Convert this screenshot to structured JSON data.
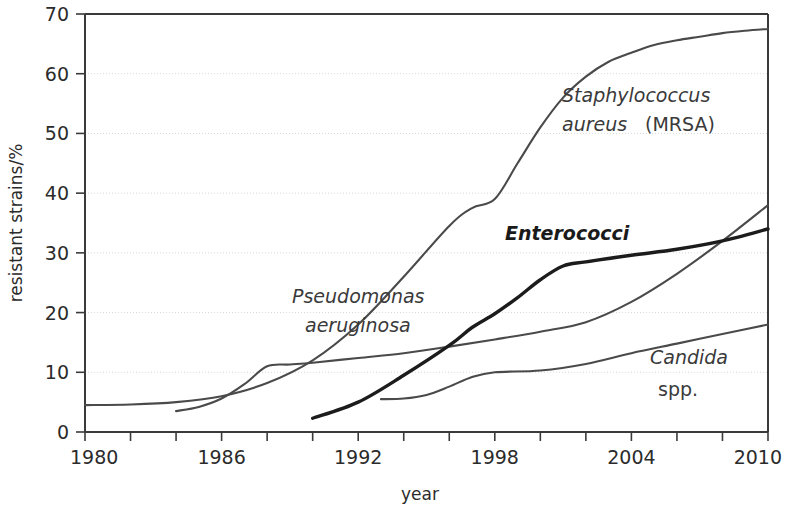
{
  "chart_data": {
    "type": "line",
    "title": "",
    "xlabel": "year",
    "ylabel": "resistant strains/%",
    "xlim": [
      1980,
      2010
    ],
    "ylim": [
      0,
      70
    ],
    "grid": true,
    "legend_position": "inline-annotations",
    "x_ticks_major": [
      1980,
      1986,
      1992,
      1998,
      2004,
      2010
    ],
    "x_ticks_minor": [
      1982,
      1984,
      1988,
      1990,
      1994,
      1996,
      2000,
      2002,
      2006,
      2008
    ],
    "y_ticks": [
      0,
      10,
      20,
      30,
      40,
      50,
      60,
      70
    ],
    "series": [
      {
        "name": "Staphylococcus aureus (MRSA)",
        "label_italic": "Staphylococcus",
        "label_italic_2": "aureus",
        "label_roman": "(MRSA)",
        "style": "thin",
        "x": [
          1980,
          1982,
          1984,
          1986,
          1988,
          1990,
          1992,
          1994,
          1996,
          1997,
          1998,
          1999,
          2000,
          2001,
          2002,
          2003,
          2004,
          2005,
          2006,
          2007,
          2008,
          2009,
          2010
        ],
        "values": [
          4.5,
          4.6,
          5.0,
          6.0,
          8.2,
          12.0,
          18.0,
          26.0,
          34.5,
          37.5,
          39.0,
          45.0,
          51.0,
          56.0,
          59.5,
          62.0,
          63.5,
          64.8,
          65.6,
          66.2,
          66.8,
          67.2,
          67.5
        ]
      },
      {
        "name": "Pseudomonas aeruginosa",
        "label_italic": "Pseudomonas",
        "label_italic_2": "aeruginosa",
        "style": "thin",
        "x": [
          1984,
          1985,
          1986,
          1987,
          1988,
          1989,
          1990,
          1992,
          1994,
          1996,
          1998,
          2000,
          2002,
          2004,
          2006,
          2008,
          2010
        ],
        "values": [
          3.5,
          4.2,
          5.6,
          8.0,
          11.0,
          11.3,
          11.6,
          12.4,
          13.2,
          14.3,
          15.5,
          16.8,
          18.4,
          21.8,
          26.5,
          32.0,
          38.0
        ]
      },
      {
        "name": "Enterococci",
        "label_bold_italic": "Enterococci",
        "style": "bold",
        "x": [
          1990,
          1992,
          1994,
          1996,
          1997,
          1998,
          1999,
          2000,
          2001,
          2002,
          2004,
          2006,
          2008,
          2010
        ],
        "values": [
          2.3,
          5.0,
          9.5,
          14.5,
          17.5,
          19.8,
          22.5,
          25.5,
          27.8,
          28.5,
          29.6,
          30.6,
          32.0,
          34.0
        ]
      },
      {
        "name": "Candida spp.",
        "label_italic": "Candida",
        "label_roman": "spp.",
        "style": "thin",
        "x": [
          1993,
          1994,
          1995,
          1996,
          1997,
          1998,
          2000,
          2002,
          2004,
          2006,
          2008,
          2010
        ],
        "values": [
          5.5,
          5.6,
          6.2,
          7.6,
          9.2,
          10.0,
          10.3,
          11.4,
          13.2,
          14.8,
          16.4,
          18.0
        ]
      }
    ],
    "annotations": [
      {
        "text": "Staphylococcus aureus (MRSA)",
        "x": 1998.5,
        "y": 56
      },
      {
        "text": "Pseudomonas aeruginosa",
        "x": 1988.5,
        "y": 24
      },
      {
        "text": "Enterococci",
        "x": 1995.5,
        "y": 33
      },
      {
        "text": "Candida spp.",
        "x": 2004.5,
        "y": 10
      }
    ]
  },
  "axes": {
    "y_title": "resistant strains/%",
    "x_title": "year",
    "y_tick_labels": [
      "0",
      "10",
      "20",
      "30",
      "40",
      "50",
      "60",
      "70"
    ],
    "x_tick_labels": [
      "1980",
      "1986",
      "1992",
      "1998",
      "2004",
      "2010"
    ]
  },
  "labels": {
    "staph_line1": "Staphylococcus",
    "staph_line2_italic": "aureus",
    "staph_line2_roman": "(MRSA)",
    "pseudo_line1": "Pseudomonas",
    "pseudo_line2": "aeruginosa",
    "entero": "Enterococci",
    "candida_italic": "Candida",
    "candida_roman": "spp."
  },
  "colors": {
    "curve_thin": "#4a4a4a",
    "curve_bold": "#1c1c1c",
    "axis": "#3a3a3a",
    "grid": "#d8d8d8",
    "text": "#2b2b2b",
    "background": "#ffffff"
  }
}
